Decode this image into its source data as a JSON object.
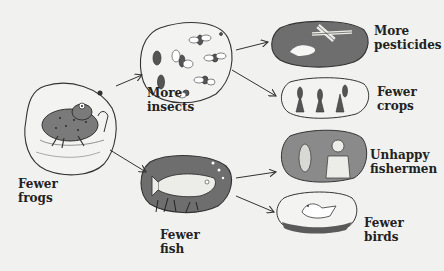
{
  "diagram": {
    "title": "",
    "colors": {
      "background": "#f1f1ef",
      "outline": "#333333",
      "dark_fill": "#6e6e6e",
      "light_fill": "#e6e6e4",
      "text": "#222222"
    },
    "nodes": [
      {
        "id": "frogs",
        "line1": "Fewer",
        "line2": "frogs"
      },
      {
        "id": "insects",
        "line1": "More",
        "line2": "insects"
      },
      {
        "id": "fish",
        "line1": "Fewer",
        "line2": "fish"
      },
      {
        "id": "pesticides",
        "line1": "More",
        "line2": "pesticides"
      },
      {
        "id": "crops",
        "line1": "Fewer",
        "line2": "crops"
      },
      {
        "id": "fishermen",
        "line1": "Unhappy",
        "line2": "fishermen"
      },
      {
        "id": "birds",
        "line1": "Fewer",
        "line2": "birds"
      }
    ],
    "edges": [
      {
        "from": "frogs",
        "to": "insects"
      },
      {
        "from": "frogs",
        "to": "fish"
      },
      {
        "from": "insects",
        "to": "pesticides"
      },
      {
        "from": "insects",
        "to": "crops"
      },
      {
        "from": "fish",
        "to": "fishermen"
      },
      {
        "from": "fish",
        "to": "birds"
      }
    ]
  }
}
